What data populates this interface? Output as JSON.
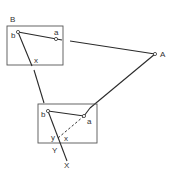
{
  "diagram": {
    "type": "plane-table-resection",
    "station_top": {
      "label": "B",
      "point_b": "b",
      "point_a": "a",
      "ray_mark": "x"
    },
    "station_bottom": {
      "point_b": "b",
      "point_a": "a",
      "mark_y": "y",
      "mark_x": "x",
      "ray_end_Y": "Y",
      "ray_end_X": "X"
    },
    "external_point": {
      "label": "A"
    },
    "colors": {
      "line": "#2a2a2a",
      "box": "#555555",
      "background": "#ffffff"
    }
  }
}
